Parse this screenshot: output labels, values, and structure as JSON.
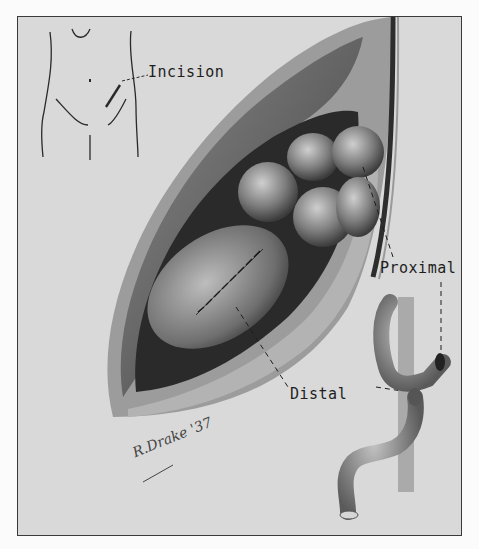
{
  "illustration": {
    "subject": "surgical illustration of bowel anastomosis through abdominal incision",
    "labels": {
      "incision": "Incision",
      "proximal": "Proximal",
      "distal": "Distal"
    },
    "signature": "R.Drake '37",
    "colors": {
      "background": "#d9d9d9",
      "page": "#fbfbfb",
      "frame_border": "#3a3a3a",
      "ink": "#1e1e1e"
    }
  }
}
